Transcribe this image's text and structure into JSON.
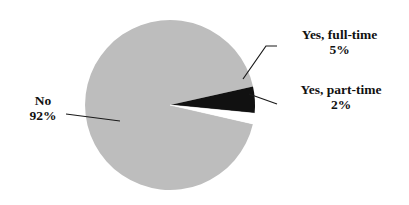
{
  "chart_data": {
    "type": "pie",
    "title": "",
    "categories": [
      "No",
      "Yes, full-time",
      "Yes, part-time"
    ],
    "values": [
      92,
      5,
      2
    ],
    "value_suffix": "%",
    "legend_position": "callout-labels",
    "grid": false,
    "slice_colors": [
      "#bdbdbd",
      "#111111",
      "#ffffff"
    ],
    "start_angle_deg": 0,
    "direction": "counterclockwise",
    "labels": [
      {
        "name": "No",
        "value_label": "92%",
        "color": "#bdbdbd"
      },
      {
        "name": "Yes, full-time",
        "value_label": "5%",
        "color": "#111111"
      },
      {
        "name": "Yes, part-time",
        "value_label": "2%",
        "color": "#ffffff"
      }
    ]
  },
  "callouts": {
    "no": {
      "line1": "No",
      "line2": "92%"
    },
    "full_time": {
      "line1": "Yes, full-time",
      "line2": "5%"
    },
    "part_time": {
      "line1": "Yes, part-time",
      "line2": "2%"
    }
  },
  "colors": {
    "slice_no": "#bdbdbd",
    "slice_full_time": "#111111",
    "slice_part_time": "#ffffff",
    "leader_line": "#1a1a1a",
    "text": "#111111",
    "background": "#ffffff"
  }
}
